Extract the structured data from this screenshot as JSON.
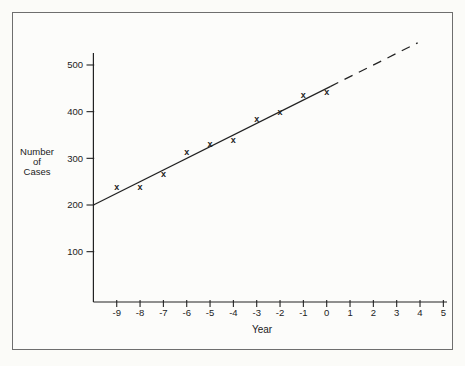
{
  "figure": {
    "background": "#fbfbf8",
    "border_color": "#6e6e6e",
    "ink_color": "#222222"
  },
  "chart_data": {
    "type": "scatter",
    "title": "",
    "xlabel": "Year",
    "ylabel": "Number of Cases",
    "ylabel_lines": [
      "Number",
      "of",
      "Cases"
    ],
    "marker_glyph": "x",
    "x_ticks": [
      -9,
      -8,
      -7,
      -6,
      -5,
      -4,
      -3,
      -2,
      -1,
      0,
      1,
      2,
      3,
      4,
      5
    ],
    "y_ticks": [
      100,
      200,
      300,
      400,
      500
    ],
    "xlim": [
      -10,
      5.2
    ],
    "ylim": [
      0,
      520
    ],
    "grid": false,
    "legend": "none",
    "points": [
      {
        "year": -9,
        "cases": 238
      },
      {
        "year": -8,
        "cases": 240
      },
      {
        "year": -7,
        "cases": 267
      },
      {
        "year": -6,
        "cases": 315
      },
      {
        "year": -5,
        "cases": 331
      },
      {
        "year": -4,
        "cases": 340
      },
      {
        "year": -3,
        "cases": 385
      },
      {
        "year": -2,
        "cases": 400
      },
      {
        "year": -1,
        "cases": 436
      },
      {
        "year": 0,
        "cases": 442
      }
    ],
    "trend_line": {
      "equation_value_at_year0": 450,
      "slope_per_year": 25,
      "solid_range_years": [
        -10,
        0.15
      ],
      "dashed_range_years": [
        0.15,
        3.9
      ]
    }
  }
}
